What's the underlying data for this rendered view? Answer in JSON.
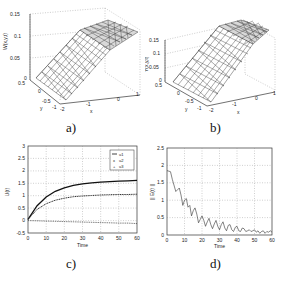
{
  "figure": {
    "panels": [
      {
        "id": "a",
        "caption": "a)"
      },
      {
        "id": "b",
        "caption": "b)"
      },
      {
        "id": "c",
        "caption": "c)"
      },
      {
        "id": "d",
        "caption": "d)"
      }
    ]
  },
  "chart_data": [
    {
      "panel": "a",
      "type": "surface3d",
      "zlabel": "W(x,y,t)",
      "xlabel": "x",
      "ylabel": "y",
      "zticks": [
        "0",
        "0.05",
        "0.1",
        "0.15"
      ],
      "yticks": [
        "0.5",
        "0",
        "-0.5",
        "-1"
      ],
      "xticks": [
        "-2",
        "-1",
        "0",
        "1"
      ],
      "xlim": [
        -2,
        1
      ],
      "ylim": [
        -1,
        0.5
      ],
      "zlim": [
        0,
        0.15
      ],
      "description": "Triangular mesh surface rising from 0 at x=-2 to plateau ~0.15 at x=1"
    },
    {
      "panel": "b",
      "type": "surface3d",
      "zlabel": "Y(x,y,t)",
      "xlabel": "x",
      "ylabel": "y",
      "zticks": [
        "0",
        "0.05",
        "0.1",
        "0.15"
      ],
      "yticks": [
        "0.5",
        "0",
        "-0.5",
        "-1"
      ],
      "xticks": [
        "-2",
        "-1",
        "0",
        "1"
      ],
      "xlim": [
        -2,
        1
      ],
      "ylim": [
        -1,
        0.5
      ],
      "zlim": [
        0,
        0.15
      ],
      "description": "Triangular mesh surface rising from 0 at x=-2 to plateau ~0.15 at x=1"
    },
    {
      "panel": "c",
      "type": "line",
      "title": "",
      "xlabel": "Time",
      "ylabel": "U(t)",
      "xlim": [
        0,
        60
      ],
      "ylim": [
        -0.5,
        3
      ],
      "xticks": [
        "0",
        "10",
        "20",
        "30",
        "40",
        "50",
        "60"
      ],
      "yticks": [
        "-0.5",
        "0",
        "0.5",
        "1",
        "1.5",
        "2",
        "2.5",
        "3"
      ],
      "grid": true,
      "legend_position": "upper right",
      "x": [
        0,
        5,
        10,
        15,
        20,
        25,
        30,
        35,
        40,
        45,
        50,
        55,
        60
      ],
      "series": [
        {
          "name": "u1",
          "style": "solid",
          "values": [
            0.05,
            0.6,
            0.95,
            1.18,
            1.32,
            1.42,
            1.48,
            1.52,
            1.55,
            1.57,
            1.59,
            1.6,
            1.62
          ]
        },
        {
          "name": "u2",
          "style": "x-markers",
          "values": [
            0.05,
            0.45,
            0.68,
            0.82,
            0.9,
            0.96,
            0.99,
            1.01,
            1.03,
            1.04,
            1.05,
            1.05,
            1.06
          ]
        },
        {
          "name": "u3",
          "style": "plus-markers",
          "values": [
            0.0,
            -0.01,
            -0.02,
            -0.03,
            -0.04,
            -0.05,
            -0.06,
            -0.07,
            -0.08,
            -0.09,
            -0.1,
            -0.1,
            -0.12
          ]
        }
      ]
    },
    {
      "panel": "d",
      "type": "line",
      "title": "",
      "xlabel": "Time",
      "ylabel": "|| E(t) ||",
      "xlim": [
        0,
        60
      ],
      "ylim": [
        0,
        2.5
      ],
      "xticks": [
        "0",
        "10",
        "20",
        "30",
        "40",
        "50",
        "60"
      ],
      "yticks": [
        "0",
        "0.5",
        "1",
        "1.5",
        "2",
        "2.5"
      ],
      "grid": true,
      "x": [
        0,
        2,
        3,
        5,
        6,
        7,
        8,
        9,
        10,
        11,
        12,
        13,
        14,
        15,
        16,
        17,
        18,
        19,
        20,
        21,
        22,
        23,
        24,
        25,
        26,
        27,
        28,
        29,
        30,
        31,
        32,
        33,
        34,
        35,
        36,
        37,
        38,
        39,
        40,
        41,
        42,
        43,
        44,
        45,
        46,
        47,
        48,
        49,
        50,
        51,
        52,
        53,
        54,
        55,
        56,
        57,
        58,
        59,
        60
      ],
      "series": [
        {
          "name": "error",
          "values": [
            1.85,
            1.82,
            1.6,
            1.25,
            1.3,
            1.35,
            1.15,
            0.85,
            1.0,
            1.05,
            0.8,
            0.85,
            0.55,
            0.7,
            0.78,
            0.6,
            0.35,
            0.45,
            0.55,
            0.42,
            0.25,
            0.38,
            0.48,
            0.3,
            0.18,
            0.32,
            0.42,
            0.25,
            0.15,
            0.3,
            0.38,
            0.2,
            0.12,
            0.28,
            0.3,
            0.15,
            0.1,
            0.22,
            0.25,
            0.12,
            0.1,
            0.2,
            0.18,
            0.1,
            0.12,
            0.15,
            0.1,
            0.12,
            0.15,
            0.08,
            0.12,
            0.05,
            0.1,
            0.12,
            0.05,
            0.1,
            0.08,
            0.12,
            0.08
          ]
        }
      ]
    }
  ]
}
